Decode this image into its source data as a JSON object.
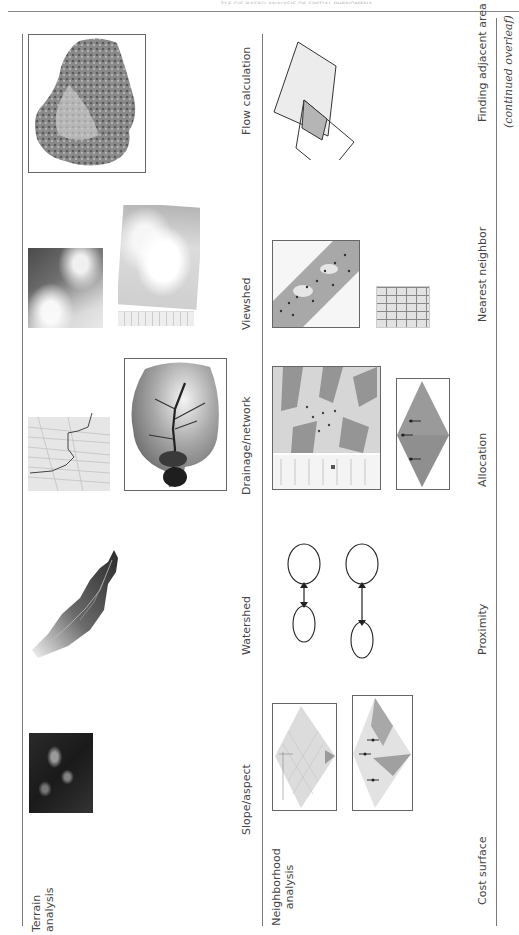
{
  "page": {
    "header_text": "316   GIS-BASED ANALYSIS OF SPATIAL PHENOMENA",
    "continued_note": "(continued overleaf)"
  },
  "rows": [
    {
      "label": "Terrain analysis",
      "label_lines": [
        "Terrain",
        "analysis"
      ],
      "items": [
        {
          "label": "Slope/aspect",
          "icon": "slope-aspect-map"
        },
        {
          "label": "Watershed",
          "icon": "watershed-map"
        },
        {
          "label": "Drainage/network",
          "icon": "drainage-network-map"
        },
        {
          "label": "Viewshed",
          "icon": "viewshed-map"
        },
        {
          "label": "Flow calculation",
          "icon": "flow-calculation-map"
        }
      ]
    },
    {
      "label": "Neighborhood analysis",
      "label_lines": [
        "Neighborhood",
        "analysis"
      ],
      "items": [
        {
          "label": "Cost surface",
          "icon": "cost-surface-diagram"
        },
        {
          "label": "Proximity",
          "icon": "proximity-diagram"
        },
        {
          "label": "Allocation",
          "icon": "allocation-diagram"
        },
        {
          "label": "Nearest neighbor",
          "icon": "nearest-neighbor-grid"
        },
        {
          "label": "Finding adjacent area",
          "icon": "adjacent-area-diagram"
        }
      ]
    }
  ],
  "colors": {
    "rule": "#7a7a7a",
    "text": "#444444",
    "overlap_fill": "#b5b5b5",
    "light_fill": "#ececec",
    "allocation_fill": "#9a9a9a"
  }
}
